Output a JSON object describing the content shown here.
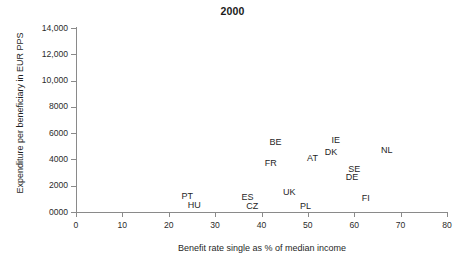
{
  "chart": {
    "title": "2000",
    "xlabel": "Benefit rate single as % of median income",
    "ylabel": "Expenditure per beneficiary in EUR PPS"
  },
  "chart_data": {
    "type": "scatter",
    "title": "2000",
    "xlabel": "Benefit rate single as % of median income",
    "ylabel": "Expenditure per beneficiary in EUR PPS",
    "xlim": [
      0,
      80
    ],
    "ylim": [
      0,
      14000
    ],
    "xticks": [
      0,
      10,
      20,
      30,
      40,
      50,
      60,
      70,
      80
    ],
    "xtick_labels": [
      "0",
      "10",
      "20",
      "30",
      "40",
      "50",
      "60",
      "70",
      "80"
    ],
    "yticks": [
      0,
      2000,
      4000,
      6000,
      8000,
      10000,
      12000,
      14000
    ],
    "ytick_labels": [
      "0000",
      "2000",
      "4000",
      "6000",
      "8000",
      "10,000",
      "12,000",
      "14,000"
    ],
    "grid": false,
    "legend": false,
    "marker": "text-label-only",
    "points": [
      {
        "label": "PT",
        "x": 24,
        "y": 1250
      },
      {
        "label": "HU",
        "x": 25.5,
        "y": 500
      },
      {
        "label": "ES",
        "x": 37,
        "y": 1150
      },
      {
        "label": "CZ",
        "x": 38,
        "y": 420
      },
      {
        "label": "FR",
        "x": 42,
        "y": 3700
      },
      {
        "label": "BE",
        "x": 43,
        "y": 5350
      },
      {
        "label": "UK",
        "x": 46,
        "y": 1550
      },
      {
        "label": "PL",
        "x": 49.5,
        "y": 420
      },
      {
        "label": "AT",
        "x": 51,
        "y": 4100
      },
      {
        "label": "DK",
        "x": 55,
        "y": 4600
      },
      {
        "label": "IE",
        "x": 56,
        "y": 5450
      },
      {
        "label": "DE",
        "x": 59.5,
        "y": 2650
      },
      {
        "label": "SE",
        "x": 60,
        "y": 3250
      },
      {
        "label": "FI",
        "x": 62.5,
        "y": 1100
      },
      {
        "label": "NL",
        "x": 67,
        "y": 4700
      }
    ]
  }
}
